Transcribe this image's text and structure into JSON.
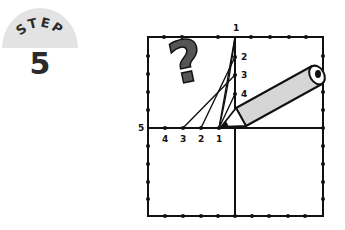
{
  "badge": {
    "label": "STEP",
    "number": "5",
    "bg_color": "#e3e3e3"
  },
  "diagram": {
    "top_labels": [
      "1",
      "2",
      "3",
      "4"
    ],
    "bottom_labels": [
      "4",
      "3",
      "2",
      "1"
    ],
    "left_label": "5",
    "question_mark": "?",
    "pencil_fill": "#d6d6d6",
    "line_color": "#111111"
  }
}
